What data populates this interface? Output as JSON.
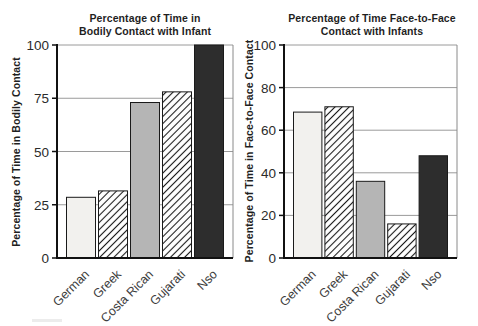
{
  "figure": {
    "background": "#ffffff"
  },
  "colors": {
    "bar_border": "#1a1a1a",
    "grid": "#9a9a9a",
    "frame": "#8a8a8a",
    "axis": "#111111",
    "title_text": "#1f1f1f",
    "tick_text": "#2b2b2b",
    "category_text": "#3d3d3d",
    "fill_light": "#f2f1ee",
    "fill_gray": "#b5b5b5",
    "fill_dark": "#2d2d2d",
    "fill_white": "#ffffff",
    "hatch_line": "#1a1a1a"
  },
  "chart_data": [
    {
      "type": "bar",
      "title": "Percentage of Time in\nBodily Contact with Infant",
      "ylabel": "Percentage of Time in Bodily Contact",
      "xlabel": "",
      "categories": [
        "German",
        "Greek",
        "Costa Rican",
        "Gujarati",
        "Nso"
      ],
      "values": [
        28.5,
        31.5,
        73,
        78,
        100
      ],
      "ylim": [
        0,
        100
      ],
      "yticks": [
        0,
        25,
        50,
        75,
        100
      ],
      "grid": "horizontal",
      "legend_position": "none",
      "bar_styles": [
        "light",
        "hatch",
        "gray",
        "hatch",
        "dark"
      ]
    },
    {
      "type": "bar",
      "title": "Percentage of Time Face-to-Face\nContact with Infants",
      "ylabel": "Percentage of Time in Face-to-Face Contact",
      "xlabel": "",
      "categories": [
        "German",
        "Greek",
        "Costa Rican",
        "Gujarati",
        "Nso"
      ],
      "values": [
        68.5,
        71,
        36,
        16,
        48
      ],
      "ylim": [
        0,
        100
      ],
      "yticks": [
        0,
        20,
        40,
        60,
        80,
        100
      ],
      "grid": "horizontal",
      "legend_position": "none",
      "bar_styles": [
        "light",
        "hatch",
        "gray",
        "hatch",
        "dark"
      ]
    }
  ]
}
